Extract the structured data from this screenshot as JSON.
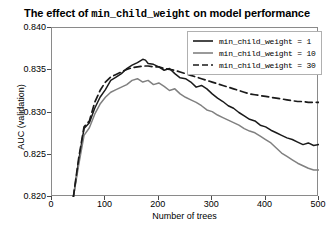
{
  "chart_data": {
    "type": "line",
    "title": "The effect of min_child_weight on model performance",
    "title_prefix": "The effect of ",
    "title_param": "min_child_weight",
    "title_suffix": " on model performance",
    "xlabel": "Number of trees",
    "ylabel": "AUC (validation)",
    "xlim": [
      0,
      500
    ],
    "ylim": [
      0.82,
      0.84
    ],
    "xticks": [
      0,
      100,
      200,
      300,
      400,
      500
    ],
    "yticks": [
      0.82,
      0.825,
      0.83,
      0.835,
      0.84
    ],
    "ytick_labels": [
      "0.820",
      "0.825",
      "0.830",
      "0.835",
      "0.840"
    ],
    "xtick_labels": [
      "0",
      "100",
      "200",
      "300",
      "400",
      "500"
    ],
    "grid": false,
    "legend_position": "upper right",
    "series": [
      {
        "name": "min_child_weight = 1",
        "color": "#1a1a1a",
        "style": "solid",
        "x": [
          40,
          50,
          60,
          70,
          80,
          90,
          100,
          110,
          120,
          130,
          140,
          150,
          160,
          170,
          175,
          180,
          190,
          200,
          210,
          220,
          230,
          240,
          250,
          260,
          270,
          280,
          290,
          300,
          310,
          320,
          330,
          340,
          350,
          360,
          370,
          380,
          390,
          400,
          410,
          420,
          430,
          440,
          450,
          460,
          470,
          480,
          490,
          500
        ],
        "y": [
          0.82,
          0.8243,
          0.8281,
          0.8288,
          0.8305,
          0.8318,
          0.8327,
          0.8338,
          0.8342,
          0.8346,
          0.8352,
          0.8356,
          0.8359,
          0.8363,
          0.8362,
          0.8358,
          0.8357,
          0.8354,
          0.835,
          0.8352,
          0.8346,
          0.8341,
          0.834,
          0.8336,
          0.833,
          0.8332,
          0.8328,
          0.8322,
          0.8317,
          0.8313,
          0.8308,
          0.8305,
          0.83,
          0.8296,
          0.8292,
          0.829,
          0.8285,
          0.8283,
          0.8279,
          0.8276,
          0.8273,
          0.827,
          0.8268,
          0.8265,
          0.8262,
          0.8264,
          0.8261,
          0.8262
        ]
      },
      {
        "name": "min_child_weight = 10",
        "color": "#808080",
        "style": "solid",
        "x": [
          40,
          50,
          60,
          70,
          80,
          90,
          100,
          110,
          120,
          130,
          140,
          150,
          160,
          170,
          180,
          190,
          200,
          210,
          220,
          230,
          240,
          250,
          260,
          270,
          280,
          290,
          300,
          310,
          320,
          330,
          340,
          350,
          360,
          370,
          380,
          390,
          400,
          410,
          420,
          430,
          440,
          450,
          460,
          470,
          480,
          490,
          500
        ],
        "y": [
          0.82,
          0.8238,
          0.8273,
          0.8282,
          0.8298,
          0.831,
          0.8318,
          0.8324,
          0.8327,
          0.833,
          0.8333,
          0.8338,
          0.834,
          0.8336,
          0.8338,
          0.8333,
          0.8335,
          0.8331,
          0.8326,
          0.8328,
          0.8322,
          0.8318,
          0.8315,
          0.8312,
          0.8308,
          0.8303,
          0.8301,
          0.8297,
          0.8294,
          0.8291,
          0.8288,
          0.8285,
          0.8281,
          0.8278,
          0.8276,
          0.8272,
          0.8268,
          0.8264,
          0.8258,
          0.8252,
          0.8248,
          0.8244,
          0.824,
          0.8237,
          0.8234,
          0.8232,
          0.8232
        ]
      },
      {
        "name": "min_child_weight = 30",
        "color": "#1a1a1a",
        "style": "dashed",
        "x": [
          40,
          50,
          60,
          70,
          80,
          90,
          100,
          110,
          120,
          130,
          140,
          150,
          160,
          170,
          180,
          190,
          200,
          210,
          220,
          230,
          240,
          250,
          260,
          270,
          280,
          290,
          300,
          310,
          320,
          330,
          340,
          350,
          360,
          370,
          380,
          390,
          400,
          410,
          420,
          430,
          440,
          450,
          460,
          470,
          480,
          490,
          500
        ],
        "y": [
          0.82,
          0.8246,
          0.8283,
          0.829,
          0.8312,
          0.8326,
          0.8336,
          0.8342,
          0.8345,
          0.8348,
          0.8351,
          0.8353,
          0.8354,
          0.8355,
          0.8355,
          0.8354,
          0.8354,
          0.8352,
          0.8351,
          0.835,
          0.8348,
          0.8346,
          0.8344,
          0.8342,
          0.834,
          0.8338,
          0.8336,
          0.8334,
          0.8332,
          0.833,
          0.8328,
          0.8326,
          0.8324,
          0.8322,
          0.8321,
          0.832,
          0.8319,
          0.8318,
          0.8317,
          0.8316,
          0.8315,
          0.8314,
          0.8313,
          0.8313,
          0.8312,
          0.8312,
          0.8312
        ]
      }
    ]
  },
  "legend": {
    "items": [
      {
        "label": "min_child_weight = 1"
      },
      {
        "label": "min_child_weight = 10"
      },
      {
        "label": "min_child_weight = 30"
      }
    ]
  }
}
